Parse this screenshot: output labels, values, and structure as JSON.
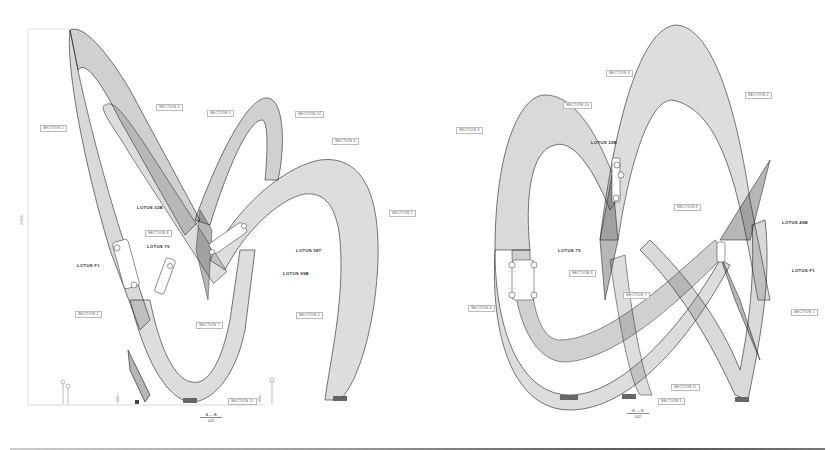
{
  "drawing": {
    "type": "architectural elevation",
    "views": [
      {
        "id": "A",
        "caption_top": "A — A",
        "caption_bottom": "002",
        "caption_pos": [
          209,
          418
        ],
        "height_dimension": "22838",
        "small_dimensions": [
          "300",
          "300"
        ],
        "labels": [
          {
            "text": "SECTION 2",
            "x": 40,
            "y": 125,
            "kind": "section"
          },
          {
            "text": "SECTION 3",
            "x": 156,
            "y": 104,
            "kind": "section"
          },
          {
            "text": "SECTION 5",
            "x": 207,
            "y": 110,
            "kind": "section"
          },
          {
            "text": "SECTION 10",
            "x": 295,
            "y": 111,
            "kind": "section"
          },
          {
            "text": "SECTION 6",
            "x": 332,
            "y": 138,
            "kind": "section"
          },
          {
            "text": "SECTION 7",
            "x": 389,
            "y": 210,
            "kind": "section"
          },
          {
            "text": "LOTUS 32B",
            "x": 135,
            "y": 205,
            "kind": "car"
          },
          {
            "text": "SECTION 8",
            "x": 145,
            "y": 230,
            "kind": "section"
          },
          {
            "text": "LOTUS 79",
            "x": 145,
            "y": 244,
            "kind": "car"
          },
          {
            "text": "LOTUS F1",
            "x": 75,
            "y": 263,
            "kind": "car"
          },
          {
            "text": "LOTUS 98T",
            "x": 294,
            "y": 248,
            "kind": "car"
          },
          {
            "text": "LOTUS 99B",
            "x": 281,
            "y": 271,
            "kind": "car"
          },
          {
            "text": "SECTION 1",
            "x": 75,
            "y": 311,
            "kind": "section"
          },
          {
            "text": "SECTION 7",
            "x": 196,
            "y": 322,
            "kind": "section"
          },
          {
            "text": "SECTION 4",
            "x": 296,
            "y": 312,
            "kind": "section"
          },
          {
            "text": "SECTION 11",
            "x": 228,
            "y": 398,
            "kind": "section"
          }
        ]
      },
      {
        "id": "B",
        "caption_top": "B — B",
        "caption_bottom": "002",
        "caption_pos": [
          637,
          412
        ],
        "labels": [
          {
            "text": "SECTION 3",
            "x": 606,
            "y": 70,
            "kind": "section"
          },
          {
            "text": "SECTION 2",
            "x": 745,
            "y": 92,
            "kind": "section"
          },
          {
            "text": "SECTION 10",
            "x": 563,
            "y": 102,
            "kind": "section"
          },
          {
            "text": "SECTION 9",
            "x": 456,
            "y": 127,
            "kind": "section"
          },
          {
            "text": "LOTUS 32B",
            "x": 589,
            "y": 140,
            "kind": "car"
          },
          {
            "text": "SECTION 8",
            "x": 674,
            "y": 204,
            "kind": "section"
          },
          {
            "text": "LOTUS 49B",
            "x": 780,
            "y": 220,
            "kind": "car"
          },
          {
            "text": "LOTUS 79",
            "x": 556,
            "y": 248,
            "kind": "car"
          },
          {
            "text": "SECTION 4",
            "x": 569,
            "y": 270,
            "kind": "section"
          },
          {
            "text": "LOTUS F1",
            "x": 790,
            "y": 268,
            "kind": "car"
          },
          {
            "text": "SECTION 7",
            "x": 623,
            "y": 292,
            "kind": "section"
          },
          {
            "text": "SECTION 6",
            "x": 468,
            "y": 305,
            "kind": "section"
          },
          {
            "text": "SECTION 1",
            "x": 791,
            "y": 309,
            "kind": "section"
          },
          {
            "text": "SECTION 11",
            "x": 671,
            "y": 384,
            "kind": "section"
          },
          {
            "text": "SECTION 5",
            "x": 658,
            "y": 398,
            "kind": "section"
          }
        ]
      }
    ]
  }
}
